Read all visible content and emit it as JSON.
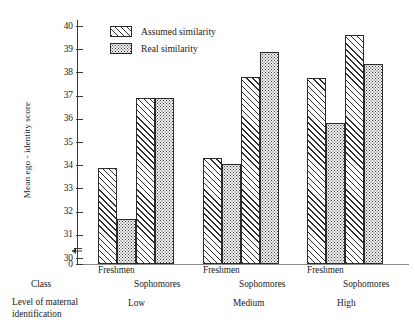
{
  "chart_data": {
    "type": "bar",
    "title": "",
    "xlabel": "Level of maternal identification",
    "ylabel": "Mean ego - identity score",
    "ylim": [
      30,
      40
    ],
    "yticks": [
      30,
      31,
      32,
      33,
      34,
      35,
      36,
      37,
      38,
      39,
      40
    ],
    "axis_origin_label": "0",
    "axis_break": true,
    "grid": false,
    "legend_position": "upper-left-inside",
    "class_row_label": "Class",
    "level_row_label_line1": "Level of maternal",
    "level_row_label_line2": "identification",
    "groups": [
      {
        "level": "Low",
        "classes": [
          {
            "name": "Freshmen",
            "assumed": 33.9,
            "real": 31.7
          },
          {
            "name": "Sophomores",
            "assumed": 36.9,
            "real": 36.9
          }
        ]
      },
      {
        "level": "Medium",
        "classes": [
          {
            "name": "Freshmen",
            "assumed": 34.3,
            "real": 34.05
          },
          {
            "name": "Sophomores",
            "assumed": 37.8,
            "real": 38.9
          }
        ]
      },
      {
        "level": "High",
        "classes": [
          {
            "name": "Freshmen",
            "assumed": 37.75,
            "real": 35.8
          },
          {
            "name": "Sophomores",
            "assumed": 39.6,
            "real": 38.35
          }
        ]
      }
    ],
    "series": [
      {
        "name": "Assumed similarity",
        "pattern": "diagonal-hatch",
        "categories": [
          "Low/Freshmen",
          "Low/Sophomores",
          "Medium/Freshmen",
          "Medium/Sophomores",
          "High/Freshmen",
          "High/Sophomores"
        ],
        "values": [
          33.9,
          36.9,
          34.3,
          37.8,
          37.75,
          39.6
        ]
      },
      {
        "name": "Real similarity",
        "pattern": "stipple-dots",
        "categories": [
          "Low/Freshmen",
          "Low/Sophomores",
          "Medium/Freshmen",
          "Medium/Sophomores",
          "High/Freshmen",
          "High/Sophomores"
        ],
        "values": [
          31.7,
          36.9,
          34.05,
          38.9,
          35.8,
          38.35
        ]
      }
    ]
  },
  "legend": {
    "items": [
      {
        "label": "Assumed similarity"
      },
      {
        "label": "Real similarity"
      }
    ]
  },
  "colors": {
    "axis": "#3a3a3a",
    "bar_outline": "#2b2b2b",
    "hatch": "#2f2f2f",
    "dots": "#3d3d3d",
    "background": "#ffffff"
  }
}
